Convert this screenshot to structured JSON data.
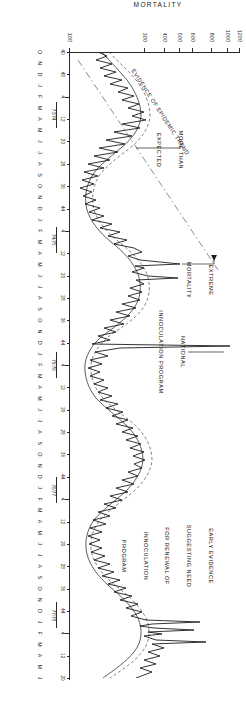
{
  "figure": {
    "orientation": "rotated-90-portrait-scan",
    "background_color": "#ffffff",
    "ink_color": "#111111"
  },
  "chart_data": {
    "type": "line",
    "title": "",
    "xlabel": "",
    "ylabel": "MORTALITY",
    "ylim": [
      100,
      1200
    ],
    "grid": false,
    "legend_position": "none",
    "y_ticks": [
      100,
      300,
      400,
      500,
      600,
      800,
      1000,
      1200
    ],
    "y_tick_labels": [
      "100",
      "300",
      "400",
      "500",
      "600",
      "800",
      "1000",
      "1200"
    ],
    "x_axis_kind": "monthly-time-series",
    "month_letters": [
      "O",
      "N",
      "D",
      "J",
      "F",
      "M",
      "A",
      "M",
      "J",
      "J",
      "A",
      "S",
      "O",
      "N",
      "D",
      "J",
      "F",
      "M",
      "A",
      "M",
      "J",
      "J",
      "A",
      "S",
      "O",
      "N",
      "D",
      "J",
      "F",
      "M",
      "A",
      "M",
      "J",
      "J",
      "A",
      "S",
      "O",
      "N",
      "D",
      "J",
      "F",
      "M",
      "A",
      "M",
      "J",
      "J",
      "A",
      "S",
      "O",
      "N",
      "D",
      "J",
      "F",
      "M",
      "A",
      "M",
      "J"
    ],
    "year_markers": [
      "73/74",
      "74/75",
      "75/76",
      "76/77",
      "77/78"
    ],
    "week_tick_labels": [
      "40",
      "48",
      "4",
      "12",
      "20",
      "28",
      "36",
      "44",
      "4",
      "12",
      "20",
      "28",
      "36",
      "44",
      "4",
      "12",
      "20",
      "28",
      "36",
      "44",
      "4",
      "12",
      "20",
      "28",
      "36",
      "44",
      "4",
      "12",
      "20"
    ],
    "series": [
      {
        "name": "observed-mortality",
        "style": "solid-thin",
        "description": "Weekly observed mortality counts with sharp epidemic spikes"
      },
      {
        "name": "expected-mortality",
        "style": "solid-smooth",
        "description": "Seasonally expected baseline mortality curve"
      },
      {
        "name": "epidemic-threshold",
        "style": "dashed",
        "description": "Epidemic threshold band running just above expected baseline"
      },
      {
        "name": "secular-trend",
        "style": "dash-dot",
        "description": "Long rising dash-dot line marking the epidemic trend"
      }
    ],
    "annotations": [
      {
        "id": "early-evidence",
        "lines": [
          "EARLY EVIDENCE",
          "SUGGESTING NEED",
          "FOR RENEWAL OF",
          "INNOCULATION",
          "PROGRAM"
        ],
        "text": "EARLY EVIDENCE SUGGESTING NEED FOR RENEWAL OF INNOCULATION PROGRAM"
      },
      {
        "id": "national-program",
        "lines": [
          "NATIONAL",
          "INNOCULATION PROGRAM"
        ],
        "text": "NATIONAL INNOCULATION PROGRAM"
      },
      {
        "id": "extreme-mortality",
        "lines": [
          "EXTREME",
          "MORTALITY"
        ],
        "text": "EXTREME MORTALITY"
      },
      {
        "id": "more-than-expected",
        "lines": [
          "MORE THAN",
          "EXPECTED"
        ],
        "text": "MORE THAN EXPECTED"
      },
      {
        "id": "evidence-of-epidemic-trend",
        "lines": [
          "EVIDENCE OF EPIDEMIC TREND"
        ],
        "text": "EVIDENCE OF EPIDEMIC TREND"
      }
    ]
  }
}
